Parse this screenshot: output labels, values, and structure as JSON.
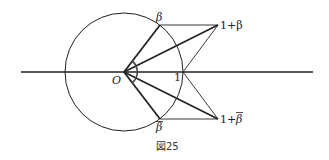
{
  "figure": {
    "caption": "図25",
    "labels": {
      "origin": "O",
      "one": "1",
      "beta": "β",
      "beta_bar": "β",
      "one_plus_beta": "1+β",
      "one_plus_beta_bar_prefix": "1+",
      "one_plus_beta_bar_sym": "β"
    },
    "colors": {
      "ink": "#222222",
      "background": "#ffffff"
    }
  }
}
